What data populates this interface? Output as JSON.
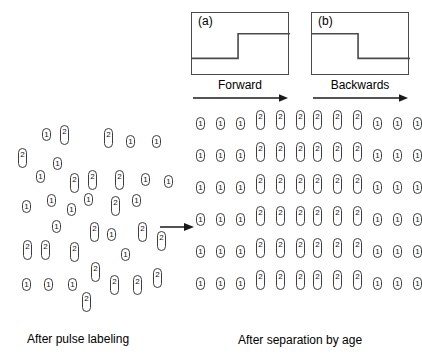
{
  "figure": {
    "left_caption": "After pulse labeling",
    "right_caption": "After separation by age"
  },
  "panels": [
    {
      "tag": "(a)",
      "direction_label": "Forward",
      "step": "rising",
      "box": {
        "x": 191,
        "y": 12,
        "width": 98,
        "height": 63
      },
      "label_x": 191,
      "label_y": 78,
      "label_w": 98,
      "arrow_x": 193,
      "arrow_y": 93,
      "arrow_w": 95,
      "grid_x": 196,
      "rows": [
        [
          "1",
          "1",
          "1",
          "2",
          "2",
          "2"
        ],
        [
          "1",
          "1",
          "1",
          "2",
          "2",
          "2"
        ],
        [
          "1",
          "1",
          "1",
          "2",
          "2",
          "2"
        ],
        [
          "1",
          "1",
          "1",
          "2",
          "2",
          "2"
        ],
        [
          "1",
          "1",
          "1",
          "2",
          "2",
          "2"
        ],
        [
          "1",
          "1",
          "1",
          "2",
          "2",
          "2"
        ]
      ]
    },
    {
      "tag": "(b)",
      "direction_label": "Backwards",
      "step": "falling",
      "box": {
        "x": 311,
        "y": 12,
        "width": 98,
        "height": 63
      },
      "label_x": 311,
      "label_y": 78,
      "label_w": 98,
      "arrow_x": 313,
      "arrow_y": 93,
      "arrow_w": 95,
      "grid_x": 313,
      "rows": [
        [
          "2",
          "2",
          "2",
          "1",
          "1",
          "1"
        ],
        [
          "2",
          "2",
          "2",
          "1",
          "1",
          "1"
        ],
        [
          "2",
          "2",
          "2",
          "1",
          "1",
          "1"
        ],
        [
          "2",
          "2",
          "2",
          "1",
          "1",
          "1"
        ],
        [
          "2",
          "2",
          "2",
          "1",
          "1",
          "1"
        ],
        [
          "2",
          "2",
          "2",
          "1",
          "1",
          "1"
        ]
      ]
    }
  ],
  "grid_layout": {
    "row_start_y": 110,
    "row_step": 32,
    "col_step": 20,
    "baseline": 13
  },
  "transition_arrow": {
    "x": 160,
    "y": 222,
    "width": 34
  },
  "scatter": [
    {
      "label": "2",
      "x": 18,
      "y": 148
    },
    {
      "label": "1",
      "x": 42,
      "y": 128
    },
    {
      "label": "2",
      "x": 60,
      "y": 125
    },
    {
      "label": "1",
      "x": 53,
      "y": 157
    },
    {
      "label": "1",
      "x": 36,
      "y": 170
    },
    {
      "label": "2",
      "x": 104,
      "y": 128
    },
    {
      "label": "1",
      "x": 126,
      "y": 135
    },
    {
      "label": "1",
      "x": 152,
      "y": 135
    },
    {
      "label": "2",
      "x": 70,
      "y": 173
    },
    {
      "label": "2",
      "x": 88,
      "y": 170
    },
    {
      "label": "2",
      "x": 115,
      "y": 170
    },
    {
      "label": "1",
      "x": 141,
      "y": 173
    },
    {
      "label": "1",
      "x": 164,
      "y": 175
    },
    {
      "label": "1",
      "x": 22,
      "y": 200
    },
    {
      "label": "1",
      "x": 47,
      "y": 194
    },
    {
      "label": "1",
      "x": 67,
      "y": 203
    },
    {
      "label": "1",
      "x": 84,
      "y": 193
    },
    {
      "label": "2",
      "x": 111,
      "y": 196
    },
    {
      "label": "1",
      "x": 132,
      "y": 194
    },
    {
      "label": "1",
      "x": 52,
      "y": 220
    },
    {
      "label": "2",
      "x": 90,
      "y": 222
    },
    {
      "label": "1",
      "x": 107,
      "y": 228
    },
    {
      "label": "2",
      "x": 138,
      "y": 222
    },
    {
      "label": "2",
      "x": 157,
      "y": 231
    },
    {
      "label": "2",
      "x": 23,
      "y": 240
    },
    {
      "label": "2",
      "x": 41,
      "y": 240
    },
    {
      "label": "2",
      "x": 70,
      "y": 242
    },
    {
      "label": "1",
      "x": 121,
      "y": 248
    },
    {
      "label": "2",
      "x": 91,
      "y": 262
    },
    {
      "label": "2",
      "x": 153,
      "y": 268
    },
    {
      "label": "1",
      "x": 22,
      "y": 278
    },
    {
      "label": "1",
      "x": 44,
      "y": 278
    },
    {
      "label": "1",
      "x": 68,
      "y": 278
    },
    {
      "label": "2",
      "x": 110,
      "y": 275
    },
    {
      "label": "2",
      "x": 133,
      "y": 275
    },
    {
      "label": "2",
      "x": 82,
      "y": 292
    }
  ],
  "captions": [
    {
      "text": "After pulse labeling",
      "x": 27,
      "y": 332
    },
    {
      "text": "After separation by age",
      "x": 238,
      "y": 333
    }
  ]
}
